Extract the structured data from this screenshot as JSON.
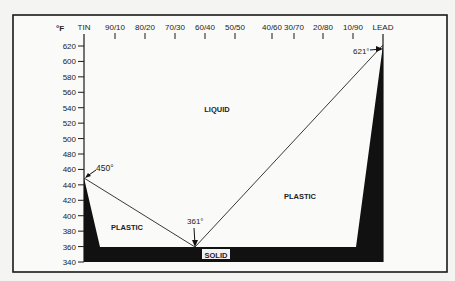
{
  "chart_data": {
    "type": "line",
    "ylabel": "°F",
    "xlabel": "",
    "ylim": [
      340,
      620
    ],
    "yticks": [
      340,
      360,
      380,
      400,
      420,
      440,
      460,
      480,
      500,
      520,
      540,
      560,
      580,
      600,
      620
    ],
    "categories": [
      "TIN",
      "90/10",
      "80/20",
      "70/30",
      "60/40",
      "50/50",
      "40/60",
      "30/70",
      "20/80",
      "10/90",
      "LEAD"
    ],
    "grid": false,
    "legend": null,
    "series": [
      {
        "name": "Liquidus",
        "points": [
          {
            "x": "TIN (100% Sn)",
            "tin_pct": 100,
            "y": 450
          },
          {
            "x": "63/37 eutectic",
            "tin_pct": 63,
            "y": 361
          },
          {
            "x": "LEAD (0% Sn)",
            "tin_pct": 0,
            "y": 621
          }
        ]
      },
      {
        "name": "Solidus",
        "points": [
          {
            "tin_pct": 100,
            "y": 450
          },
          {
            "tin_pct": 95,
            "y": 361
          },
          {
            "tin_pct": 10,
            "y": 361
          },
          {
            "tin_pct": 0,
            "y": 621
          }
        ]
      }
    ],
    "regions": [
      "LIQUID",
      "PLASTIC",
      "PLASTIC",
      "SOLID"
    ],
    "annotations": [
      {
        "text": "450°",
        "at": "TIN",
        "value": 450
      },
      {
        "text": "361°",
        "at": "eutectic",
        "value": 361
      },
      {
        "text": "621°",
        "at": "LEAD",
        "value": 621
      }
    ]
  },
  "labels": {
    "unit": "°F",
    "liquid": "LIQUID",
    "plastic_left": "PLASTIC",
    "plastic_right": "PLASTIC",
    "solid": "SOLID",
    "ann_tin": "450°",
    "ann_eutectic": "361°",
    "ann_lead": "621°"
  }
}
